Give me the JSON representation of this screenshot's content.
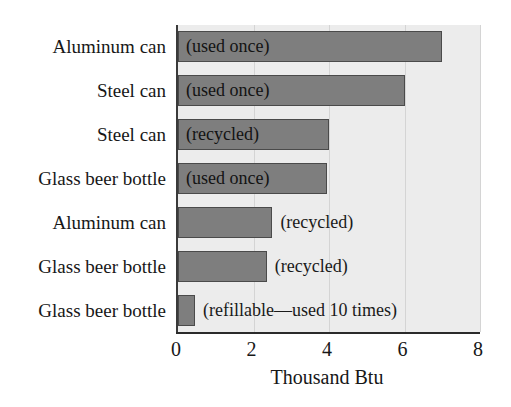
{
  "chart_data": {
    "type": "bar",
    "orientation": "horizontal",
    "title": "",
    "xlabel": "Thousand Btu",
    "ylabel": "",
    "xlim": [
      0,
      8
    ],
    "xticks": [
      0,
      2,
      4,
      6,
      8
    ],
    "xtick_labels": [
      "0",
      "2",
      "4",
      "6",
      "8"
    ],
    "grid": true,
    "grid_axis": "x",
    "legend": false,
    "categories": [
      "Aluminum can",
      "Steel can",
      "Steel can",
      "Glass beer bottle",
      "Aluminum can",
      "Glass beer bottle",
      "Glass beer bottle"
    ],
    "annotations": [
      "(used once)",
      "(used once)",
      "(recycled)",
      "(used once)",
      "(recycled)",
      "(recycled)",
      "(refillable—used 10 times)"
    ],
    "values": [
      7.0,
      6.0,
      4.0,
      3.95,
      2.5,
      2.35,
      0.45
    ],
    "units": "Thousand Btu",
    "bars": [
      {
        "category": "Aluminum can",
        "annotation": "(used once)",
        "value": 7.0,
        "annotation_position": "inside"
      },
      {
        "category": "Steel can",
        "annotation": "(used once)",
        "value": 6.0,
        "annotation_position": "inside"
      },
      {
        "category": "Steel can",
        "annotation": "(recycled)",
        "value": 4.0,
        "annotation_position": "inside"
      },
      {
        "category": "Glass beer bottle",
        "annotation": "(used once)",
        "value": 3.95,
        "annotation_position": "inside"
      },
      {
        "category": "Aluminum can",
        "annotation": "(recycled)",
        "value": 2.5,
        "annotation_position": "outside"
      },
      {
        "category": "Glass beer bottle",
        "annotation": "(recycled)",
        "value": 2.35,
        "annotation_position": "outside"
      },
      {
        "category": "Glass beer bottle",
        "annotation": "(refillable—used 10 times)",
        "value": 0.45,
        "annotation_position": "outside"
      }
    ]
  },
  "colors": {
    "bar_fill": "#7e7e7e",
    "bar_edge": "#4a4a4a",
    "plot_background": "#ececec",
    "figure_background": "#ffffff",
    "gridline": "#d4d4d4",
    "axis_line": "#2b2b2b",
    "text": "#171717"
  }
}
